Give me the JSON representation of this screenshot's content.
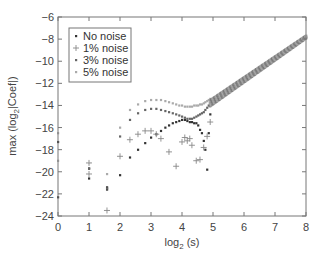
{
  "chart_data": {
    "type": "scatter",
    "title": "",
    "xlabel": "log2 (s)",
    "xlabel_main": "log",
    "xlabel_sub": "2",
    "xlabel_tail": " (s)",
    "ylabel": "max (log2|Coef|)",
    "ylabel_main": "max (log",
    "ylabel_sub": "2",
    "ylabel_tail": "|Coef|)",
    "xlim": [
      0,
      8
    ],
    "ylim": [
      -24,
      -6
    ],
    "xticks": [
      0,
      1,
      2,
      3,
      4,
      5,
      6,
      7,
      8
    ],
    "yticks": [
      -6,
      -8,
      -10,
      -12,
      -14,
      -16,
      -18,
      -20,
      -22,
      -24
    ],
    "grid": false,
    "legend_position": "upper left",
    "series": [
      {
        "name": "No noise",
        "marker": "dot",
        "color": "#333333",
        "x": [
          0,
          0,
          1,
          1,
          1.58,
          1.58,
          2,
          2.32,
          2.58,
          2.81,
          3.0,
          3.17,
          3.32,
          3.46,
          3.58,
          3.7,
          3.81,
          3.91,
          4.0,
          4.09,
          4.17,
          4.25,
          4.32,
          4.39,
          4.46,
          4.52,
          4.58,
          4.64,
          4.7,
          4.75,
          4.81,
          4.86,
          4.91
        ],
        "y": [
          -17.3,
          -22.3,
          -20.6,
          -19.7,
          -21.4,
          -21.6,
          -20.3,
          -18.7,
          -18.0,
          -17.4,
          -16.9,
          -16.6,
          -16.3,
          -16.0,
          -15.8,
          -15.6,
          -15.5,
          -15.4,
          -15.3,
          -15.3,
          -15.4,
          -15.5,
          -15.5,
          -15.6,
          -15.6,
          -15.8,
          -16.2,
          -16.5,
          -17.2,
          -18.0,
          -19.8,
          -16.5,
          -14.8
        ]
      },
      {
        "name": "1% noise",
        "marker": "plus",
        "color": "#888888",
        "x": [
          1,
          1,
          1.58,
          2,
          2.32,
          2.58,
          2.81,
          3.0,
          3.17,
          3.32,
          3.58,
          3.81,
          4.0,
          4.09,
          4.17,
          4.25,
          4.32,
          4.46,
          4.58,
          4.7,
          4.81,
          4.91
        ],
        "y": [
          -19.2,
          -20.2,
          -23.5,
          -18.6,
          -17.1,
          -16.6,
          -16.3,
          -16.3,
          -16.6,
          -17.0,
          -18.2,
          -19.5,
          -17.3,
          -16.9,
          -17.2,
          -17.0,
          -17.6,
          -19.0,
          -18.9,
          -17.8,
          -16.8,
          -15.5
        ]
      },
      {
        "name": "3% noise",
        "marker": "dot",
        "color": "#666666",
        "x": [
          1,
          1.58,
          2,
          2.32,
          2.58,
          2.81,
          3.0,
          3.17,
          3.32,
          3.46,
          3.58,
          3.7,
          3.81,
          3.91,
          4.0,
          4.09,
          4.17,
          4.25,
          4.32,
          4.39,
          4.46,
          4.52,
          4.58,
          4.64,
          4.7,
          4.75,
          4.81,
          4.86,
          4.91
        ],
        "y": [
          -19.7,
          -21.5,
          -16.8,
          -15.3,
          -14.7,
          -14.4,
          -14.3,
          -14.3,
          -14.4,
          -14.5,
          -14.6,
          -14.7,
          -14.8,
          -14.9,
          -15.0,
          -15.1,
          -15.2,
          -15.2,
          -15.2,
          -15.1,
          -15.0,
          -14.9,
          -14.8,
          -14.7,
          -14.6,
          -14.4,
          -14.2,
          -14.0,
          -13.8
        ]
      },
      {
        "name": "5% noise",
        "marker": "dot",
        "color": "#aaaaaa",
        "x": [
          0,
          0,
          1,
          1.58,
          2,
          2.32,
          2.58,
          2.81,
          3.0,
          3.17,
          3.32,
          3.46,
          3.58,
          3.7,
          3.81,
          3.91,
          4.0,
          4.09,
          4.17,
          4.25,
          4.32,
          4.39,
          4.46,
          4.52,
          4.58,
          4.64,
          4.7,
          4.75,
          4.81,
          4.86,
          4.91
        ],
        "y": [
          -16.5,
          -19.0,
          -19.2,
          -20.2,
          -16.0,
          -14.4,
          -13.9,
          -13.6,
          -13.5,
          -13.5,
          -13.5,
          -13.6,
          -13.7,
          -13.8,
          -13.9,
          -14.0,
          -14.0,
          -14.1,
          -14.1,
          -14.1,
          -14.1,
          -14.0,
          -14.0,
          -14.0,
          -13.9,
          -13.9,
          -13.8,
          -13.7,
          -13.6,
          -13.5,
          -13.4
        ]
      },
      {
        "name": "shared (all series, s large)",
        "marker": "dot",
        "color": "#999999",
        "x_range": [
          4.9,
          8.0
        ],
        "y_range": [
          -13.8,
          -7.8
        ]
      }
    ]
  },
  "legend": {
    "items": [
      {
        "label": "No noise",
        "marker": "dot",
        "color": "#333333"
      },
      {
        "label": "1% noise",
        "marker": "plus",
        "color": "#888888"
      },
      {
        "label": "3% noise",
        "marker": "dot",
        "color": "#666666"
      },
      {
        "label": "5% noise",
        "marker": "dot",
        "color": "#aaaaaa"
      }
    ]
  }
}
